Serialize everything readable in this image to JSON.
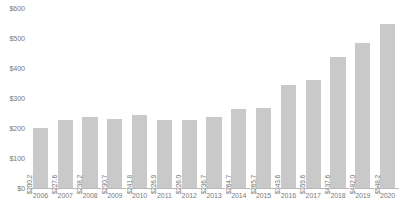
{
  "chart_data": {
    "type": "bar",
    "title": "",
    "subtitle": "",
    "xlabel": "",
    "ylabel": "",
    "grid": false,
    "legend": "none",
    "ylim": [
      0,
      600
    ],
    "yticks": [
      0,
      100,
      200,
      300,
      400,
      500,
      600
    ],
    "ytick_labels": [
      "$0",
      "$100",
      "$200",
      "$300",
      "$400",
      "$500",
      "$600"
    ],
    "categories": [
      "2006",
      "2007",
      "2008",
      "2009",
      "2010",
      "2011",
      "2012",
      "2013",
      "2014",
      "2015",
      "2016",
      "2017",
      "2018",
      "2019",
      "2020"
    ],
    "values": [
      200.2,
      227.6,
      238.2,
      230.7,
      241.8,
      226.9,
      226.0,
      236.7,
      264.7,
      265.7,
      343.6,
      359.6,
      437.6,
      482.0,
      548.2
    ],
    "value_labels": [
      "$200.2",
      "$227.6",
      "$238.2",
      "$230.7",
      "$241.8",
      "$226.9",
      "$226.0",
      "$236.7",
      "$264.7",
      "$265.7",
      "$343.6",
      "$359.6",
      "$437.6",
      "$482.0",
      "$548.2"
    ],
    "bar_color": "#c9c9c9",
    "label_color": "#6f6f6f",
    "axis_color": "#7b7b7b",
    "background_color": "#ffffff"
  },
  "source_note": ""
}
